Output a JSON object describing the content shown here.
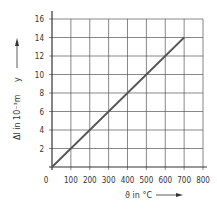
{
  "chart_data": {
    "type": "line",
    "title": "",
    "xlabel": "ϑ in °C",
    "ylabel": "Δl in 10⁻³m",
    "y_symbol": "y",
    "xlim": [
      0,
      800
    ],
    "ylim": [
      0,
      16
    ],
    "x_ticks": [
      0,
      100,
      200,
      300,
      400,
      500,
      600,
      700,
      800
    ],
    "y_ticks": [
      2,
      4,
      6,
      8,
      10,
      12,
      14,
      16
    ],
    "grid": true,
    "legend": null,
    "series": [
      {
        "name": "thermal expansion",
        "x": [
          0,
          100,
          200,
          300,
          400,
          500,
          600,
          700
        ],
        "y": [
          0,
          2,
          4,
          6,
          8,
          10,
          12,
          14
        ],
        "color": "#555555"
      }
    ]
  },
  "axes": {
    "x_label": "ϑ in °C",
    "y_label": "Δl in 10⁻³m",
    "y_symbol": "y",
    "origin_label": "0"
  },
  "colors": {
    "grid": "#555555",
    "axis": "#333333",
    "line": "#555555",
    "text": "#333333"
  }
}
